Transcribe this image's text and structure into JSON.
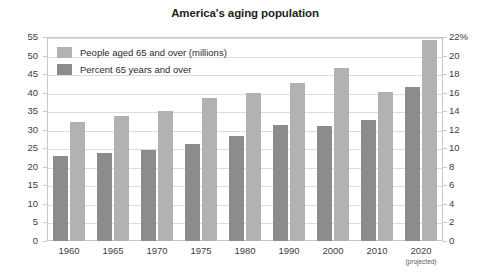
{
  "chart_data": {
    "type": "bar",
    "title": "America's aging population",
    "categories": [
      "1960",
      "1965",
      "1970",
      "1975",
      "1980",
      "1990",
      "2000",
      "2010",
      "2020"
    ],
    "category_sublabels": [
      "",
      "",
      "",
      "",
      "",
      "",
      "",
      "",
      "(projected)"
    ],
    "series": [
      {
        "name": "Percent 65 years and over",
        "axis": "right",
        "unit": "%",
        "color": "#8c8c8c",
        "values": [
          9.2,
          9.5,
          9.8,
          10.5,
          11.3,
          12.5,
          12.4,
          13.0,
          16.6
        ]
      },
      {
        "name": "People aged 65 and over (millions)",
        "axis": "left",
        "unit": "millions",
        "color": "#b2b2b2",
        "values": [
          32.2,
          33.8,
          35.0,
          38.5,
          40.0,
          42.6,
          46.6,
          40.3,
          54.1
        ]
      }
    ],
    "xlabel": "",
    "ylabel": "Millions",
    "ylim": [
      0,
      55
    ],
    "y_ticks": [
      "0",
      "5",
      "10",
      "15",
      "20",
      "25",
      "30",
      "35",
      "40",
      "45",
      "50",
      "55"
    ],
    "y2label": "",
    "y2lim": [
      0,
      22
    ],
    "y2_ticks": [
      "0",
      "2",
      "4",
      "6",
      "8",
      "10",
      "12",
      "14",
      "16",
      "18",
      "20",
      "22%"
    ],
    "grid": true,
    "legend_position": "top-left"
  },
  "legend": {
    "items": [
      {
        "label": "People aged 65 and over (millions)",
        "color": "#b2b2b2"
      },
      {
        "label": "Percent 65 years and over",
        "color": "#8c8c8c"
      }
    ]
  }
}
